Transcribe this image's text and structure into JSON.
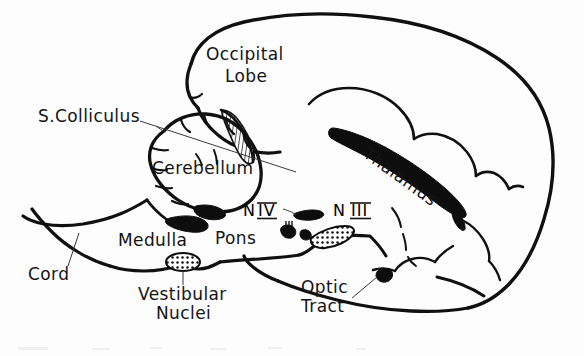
{
  "figure": {
    "kind": "anatomical-line-drawing",
    "background_color": "#fdfdfd",
    "ink_color": "#101010",
    "width": 584,
    "height": 356
  },
  "labels": {
    "occipital_lobe_line1": "Occipital",
    "occipital_lobe_line2": "Lobe",
    "s_colliculus": "S.Colliculus",
    "cerebellum": "Cerebellum",
    "thalamus": "Thalamus",
    "medulla": "Medulla",
    "pons": "Pons",
    "cord": "Cord",
    "vestibular_line1": "Vestibular",
    "vestibular_line2": "Nuclei",
    "optic_line1": "Optic",
    "optic_line2": "Tract",
    "nerve_four_prefix": "N",
    "nerve_four_numeral": "IV",
    "nerve_three_prefix": "N",
    "nerve_three_numeral": "III"
  },
  "structures": [
    {
      "name": "cerebral-hemisphere-outline",
      "style": "outline"
    },
    {
      "name": "occipital-lobe",
      "style": "outline"
    },
    {
      "name": "cerebellum",
      "style": "outline-foliated"
    },
    {
      "name": "superior-colliculus",
      "style": "hatched"
    },
    {
      "name": "thalamus",
      "style": "solid-black"
    },
    {
      "name": "medulla",
      "style": "outline-with-solid-accent"
    },
    {
      "name": "pons",
      "style": "outline"
    },
    {
      "name": "spinal-cord",
      "style": "outline"
    },
    {
      "name": "vestibular-nuclei",
      "style": "stippled-oval"
    },
    {
      "name": "oculomotor-nucleus",
      "style": "stippled-oval"
    },
    {
      "name": "trochlear-nucleus",
      "style": "solid-black"
    },
    {
      "name": "optic-tract",
      "style": "solid-black-marker"
    }
  ]
}
